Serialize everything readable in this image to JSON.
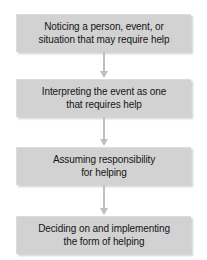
{
  "diagram": {
    "background_color": "#ffffff",
    "box_fill_color": "#d2d2d2",
    "text_color": "#151515",
    "arrow_color": "#bfbfbf",
    "orientation": "vertical",
    "steps": [
      {
        "index": 1,
        "text": "Noticing a person, event, or situation that may require help",
        "line1": "Noticing a person, event, or",
        "line2": "situation that may require help"
      },
      {
        "index": 2,
        "text": "Interpreting the event as one that requires help",
        "line1": "Interpreting the event as one",
        "line2": "that requires help"
      },
      {
        "index": 3,
        "text": "Assuming responsibility for helping",
        "line1": "Assuming responsibility",
        "line2": "for helping"
      },
      {
        "index": 4,
        "text": "Deciding on and implementing the form of helping",
        "line1": "Deciding on and implementing",
        "line2": "the form of helping"
      }
    ],
    "connectors": [
      {
        "from": 1,
        "to": 2,
        "kind": "down-arrow"
      },
      {
        "from": 2,
        "to": 3,
        "kind": "down-arrow"
      },
      {
        "from": 3,
        "to": 4,
        "kind": "down-arrow"
      }
    ]
  }
}
